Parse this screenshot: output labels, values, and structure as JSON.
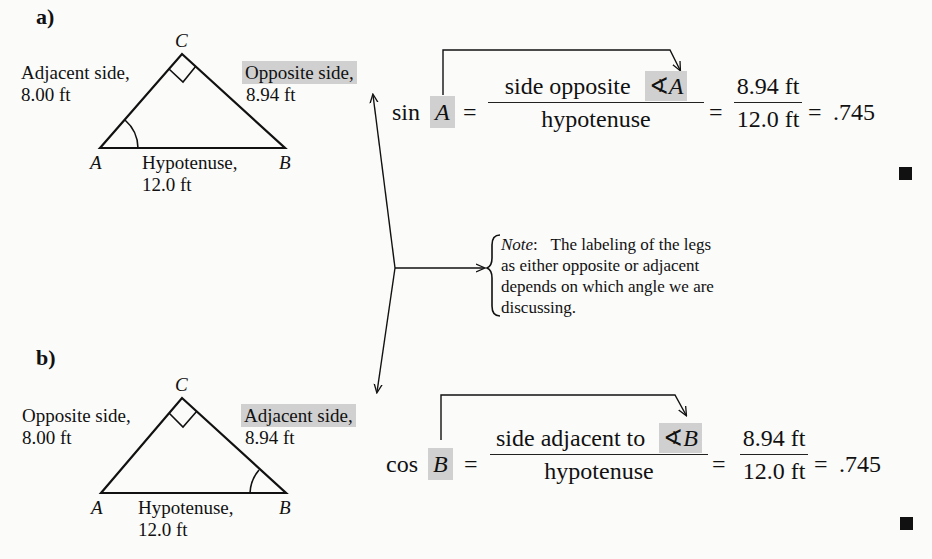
{
  "part_a": {
    "label": "a)",
    "vertices": {
      "A": "A",
      "B": "B",
      "C": "C"
    },
    "left_leg": {
      "line1": "Adjacent side,",
      "line2": "8.00 ft"
    },
    "right_leg": {
      "line1": "Opposite side,",
      "line2": "8.94 ft"
    },
    "hypotenuse": {
      "line1": "Hypotenuse,",
      "line2": "12.0 ft"
    },
    "marked_angle": "A",
    "equation": {
      "function": "sin",
      "angle": "A",
      "ratio_numerator_text": "side opposite",
      "angle_symbol": "∢",
      "ratio_numerator_angle": "A",
      "ratio_denominator": "hypotenuse",
      "value_numerator": "8.94 ft",
      "value_denominator": "12.0 ft",
      "equals": "=",
      "result": ".745"
    }
  },
  "part_b": {
    "label": "b)",
    "vertices": {
      "A": "A",
      "B": "B",
      "C": "C"
    },
    "left_leg": {
      "line1": "Opposite side,",
      "line2": "8.00 ft"
    },
    "right_leg": {
      "line1": "Adjacent side,",
      "line2": "8.94 ft"
    },
    "hypotenuse": {
      "line1": "Hypotenuse,",
      "line2": "12.0 ft"
    },
    "marked_angle": "B",
    "equation": {
      "function": "cos",
      "angle": "B",
      "ratio_numerator_text": "side adjacent to",
      "angle_symbol": "∢",
      "ratio_numerator_angle": "B",
      "ratio_denominator": "hypotenuse",
      "value_numerator": "8.94 ft",
      "value_denominator": "12.0 ft",
      "equals": "=",
      "result": ".745"
    }
  },
  "note": {
    "prefix": "Note",
    "colon": ":",
    "line1": "The labeling of the legs",
    "line2": "as either opposite or adjacent",
    "line3": "depends on which angle we are",
    "line4": "discussing."
  },
  "colors": {
    "highlight": "#d0d0d0",
    "ink": "#111111",
    "background": "#fbfbfa"
  }
}
